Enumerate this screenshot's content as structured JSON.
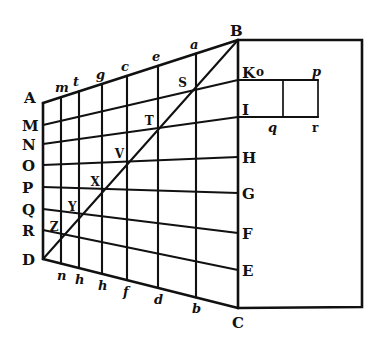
{
  "figure": {
    "type": "geometric perspective diagram (woodcut)",
    "ink_color": "#111111",
    "background": "#ffffff"
  },
  "labels": {
    "corners": {
      "A": "A",
      "B": "B",
      "C": "C",
      "D": "D"
    },
    "left_edge": [
      "A",
      "M",
      "N",
      "O",
      "P",
      "Q",
      "R",
      "D"
    ],
    "right_edge": [
      "B",
      "K",
      "I",
      "H",
      "G",
      "F",
      "E",
      "C"
    ],
    "top_edge": [
      "m",
      "t",
      "g",
      "c",
      "e",
      "a"
    ],
    "bottom_edge": [
      "n",
      "h",
      "h",
      "f",
      "d",
      "b"
    ],
    "diagonal": [
      "Z",
      "Y",
      "X",
      "V",
      "T",
      "S"
    ],
    "small_box_top": [
      "K",
      "o",
      "p"
    ],
    "small_box_bottom": [
      "I",
      "q",
      "r"
    ]
  },
  "geometry": {
    "left_edge_x": 43,
    "right_edge_x": 238,
    "verticals_x": [
      43,
      61,
      79,
      102,
      127,
      158,
      196,
      238
    ],
    "left_y": [
      103,
      125,
      144,
      165,
      187,
      209,
      230,
      259
    ],
    "right_y": [
      40,
      80,
      117,
      157,
      193,
      233,
      270,
      308
    ],
    "outer_rect": {
      "x1": 238,
      "y1": 40,
      "x2": 362,
      "y2": 307
    },
    "small_box": {
      "x1": 238,
      "x_mid": 283,
      "x2": 318,
      "y_top": 80,
      "y_bottom": 117
    }
  }
}
